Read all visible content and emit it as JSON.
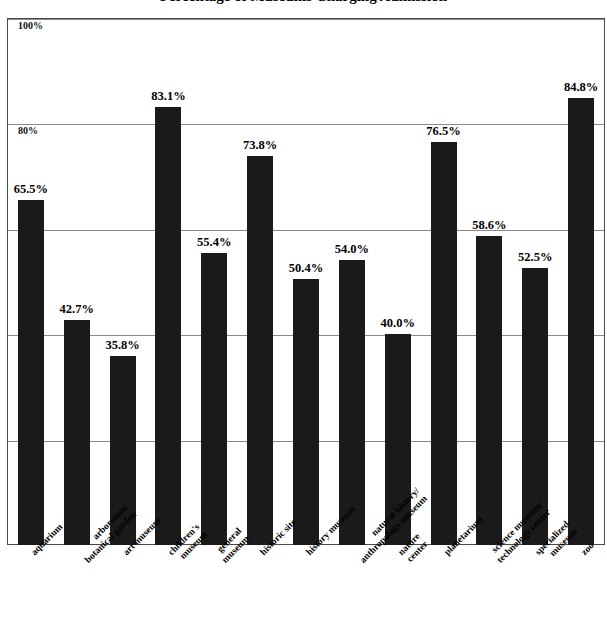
{
  "chart_data": {
    "type": "bar",
    "title": "Percentage of Museums Charging Admission",
    "xlabel": "",
    "ylabel": "",
    "ylim": [
      0,
      100
    ],
    "grid": true,
    "legend": "none",
    "ytick_labels": [
      "100%",
      "80%",
      "60%",
      "40%",
      "20%"
    ],
    "ytick_values": [
      100,
      80,
      60,
      40,
      20
    ],
    "bar_color": "#1a1a1a",
    "gridline_color": "#8b8b8b",
    "frame_color": "#4a4a4a",
    "categories": [
      "aquarium",
      "arboretum/ botanical garden",
      "art museum",
      "children's museum",
      "general museum",
      "historic site",
      "history museum",
      "natural history/ anthropology museum",
      "nature center",
      "planetarium",
      "science museum/ technology center",
      "specialized museum",
      "zoo"
    ],
    "category_lines": [
      [
        "aquarium"
      ],
      [
        "arboretum/",
        "botanical garden"
      ],
      [
        "art museum"
      ],
      [
        "children's",
        "museum"
      ],
      [
        "general",
        "museum"
      ],
      [
        "historic site"
      ],
      [
        "history museum"
      ],
      [
        "natural history/",
        "anthropology museum"
      ],
      [
        "nature",
        "center"
      ],
      [
        "planetarium"
      ],
      [
        "science museum/",
        "technology center"
      ],
      [
        "specialized",
        "museum"
      ],
      [
        "zoo"
      ]
    ],
    "values": [
      65.5,
      42.7,
      35.8,
      83.1,
      55.4,
      73.8,
      50.4,
      54.0,
      40.0,
      76.5,
      58.6,
      52.5,
      84.8
    ],
    "value_labels": [
      "65.5%",
      "42.7%",
      "35.8%",
      "83.1%",
      "55.4%",
      "73.8%",
      "50.4%",
      "54.0%",
      "40.0%",
      "76.5%",
      "58.6%",
      "52.5%",
      "84.8%"
    ]
  }
}
